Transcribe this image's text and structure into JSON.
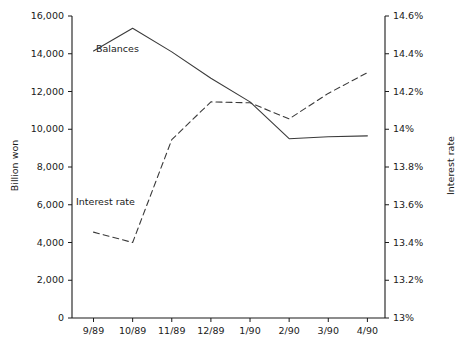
{
  "chart_data": {
    "type": "line",
    "title": "",
    "subtitle": "",
    "xlabel": "",
    "ylabel": "Billion won",
    "y2label": "Interest rate",
    "grid": false,
    "legend_position": "inline-annotation",
    "categories": [
      "9/89",
      "10/89",
      "11/89",
      "12/89",
      "1/90",
      "2/90",
      "3/90",
      "4/90"
    ],
    "ylim": [
      0,
      16000
    ],
    "yticks": [
      0,
      2000,
      4000,
      6000,
      8000,
      10000,
      12000,
      14000,
      16000
    ],
    "ytick_labels": [
      "0",
      "2,000",
      "4,000",
      "6,000",
      "8,000",
      "10,000",
      "12,000",
      "14,000",
      "16,000"
    ],
    "y2lim": [
      13.0,
      14.6
    ],
    "y2ticks": [
      13.0,
      13.2,
      13.4,
      13.6,
      13.8,
      14.0,
      14.2,
      14.4,
      14.6
    ],
    "y2tick_labels": [
      "13%",
      "13.2%",
      "13.4%",
      "13.6%",
      "13.8%",
      "14%",
      "14.2%",
      "14.4%",
      "14.6%"
    ],
    "series": [
      {
        "name": "Balances",
        "axis": "left",
        "style": "solid",
        "color": "#3a3a3a",
        "units": "Billion won",
        "values": [
          14150,
          15350,
          14100,
          12700,
          11450,
          9500,
          9600,
          9650
        ]
      },
      {
        "name": "Interest rate",
        "axis": "right",
        "style": "dashed",
        "color": "#3a3a3a",
        "units": "%",
        "values": [
          13.455,
          13.4,
          13.945,
          14.145,
          14.14,
          14.055,
          14.19,
          14.3
        ]
      }
    ],
    "annotations": [
      {
        "text": "Balances",
        "series": "Balances"
      },
      {
        "text": "Interest rate",
        "series": "Interest rate"
      }
    ]
  },
  "axes": {
    "left_title": "Billion won",
    "right_title": "Interest rate"
  },
  "colors": {
    "axis": "#1a1a1a",
    "balances_line": "#3a3a3a",
    "interest_line": "#3a3a3a",
    "background": "#ffffff"
  }
}
